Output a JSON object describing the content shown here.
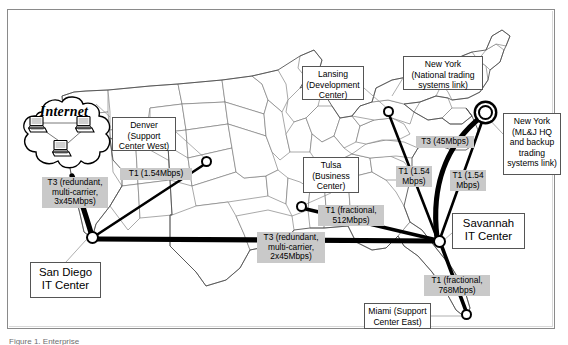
{
  "figure": {
    "kind": "network-topology-map",
    "caption_partial": "Figure 1. Enterprise"
  },
  "cloud": {
    "label": "Internet",
    "node_icons": [
      "computer-icon",
      "computer-icon",
      "computer-icon"
    ]
  },
  "sites": [
    {
      "id": "denver",
      "label": "Denver\n(Support\nCenter West)",
      "box": {
        "x": 112,
        "y": 117,
        "w": 64,
        "h": 34
      }
    },
    {
      "id": "lansing",
      "label": "Lansing\n(Development\nCenter)",
      "box": {
        "x": 302,
        "y": 66,
        "w": 62,
        "h": 34
      }
    },
    {
      "id": "newyork1",
      "label": "New York\n(National trading\nsystems link)",
      "box": {
        "x": 403,
        "y": 56,
        "w": 80,
        "h": 34
      }
    },
    {
      "id": "newyork2",
      "label": "New York\n(ML&J HQ\nand backup\ntrading\nsystems link)",
      "box": {
        "x": 503,
        "y": 113,
        "w": 58,
        "h": 62
      }
    },
    {
      "id": "tulsa",
      "label": "Tulsa\n(Business\nCenter)",
      "box": {
        "x": 303,
        "y": 157,
        "w": 56,
        "h": 36
      }
    },
    {
      "id": "miami",
      "label": "Miami (Support\nCenter East)",
      "box": {
        "x": 364,
        "y": 303,
        "w": 67,
        "h": 26
      }
    },
    {
      "id": "sandiego",
      "label": "San Diego\nIT Center",
      "box": {
        "x": 30,
        "y": 262,
        "w": 71,
        "h": 36
      }
    },
    {
      "id": "savannah",
      "label": "Savannah\nIT Center",
      "box": {
        "x": 452,
        "y": 213,
        "w": 73,
        "h": 36
      }
    }
  ],
  "links": [
    {
      "id": "internet-sandiego",
      "speed": "T3 (redundant,\nmulti-carrier,\n3x45Mbps)",
      "label_box": {
        "x": 42,
        "y": 177,
        "w": 66,
        "h": 32
      }
    },
    {
      "id": "denver-sandiego",
      "speed": "T1 (1.54Mbps)",
      "label_box": {
        "x": 120,
        "y": 168,
        "w": 72,
        "h": 12
      }
    },
    {
      "id": "sandiego-savannah",
      "speed": "T3 (redundant,\nmulti-carrier,\n2x45Mbps)",
      "label_box": {
        "x": 257,
        "y": 232,
        "w": 68,
        "h": 32
      }
    },
    {
      "id": "tulsa-savannah",
      "speed": "T1 (fractional,\n512Mbps)",
      "label_box": {
        "x": 318,
        "y": 205,
        "w": 66,
        "h": 22
      }
    },
    {
      "id": "lansing-savannah",
      "speed": "T1 (1.54\nMbps)",
      "label_box": {
        "x": 396,
        "y": 166,
        "w": 36,
        "h": 22
      }
    },
    {
      "id": "newyork-savannah1",
      "speed": "T3 (45Mbps)",
      "label_box": {
        "x": 416,
        "y": 136,
        "w": 58,
        "h": 12
      }
    },
    {
      "id": "newyork-savannah2",
      "speed": "T1 (1.54\nMbps)",
      "label_box": {
        "x": 450,
        "y": 170,
        "w": 36,
        "h": 22
      }
    },
    {
      "id": "savannah-miami",
      "speed": "T1 (fractional,\n768Mbps)",
      "label_box": {
        "x": 424,
        "y": 275,
        "w": 66,
        "h": 22
      }
    }
  ],
  "nodes": [
    {
      "id": "denver-node",
      "x": 207,
      "y": 162,
      "style": "small"
    },
    {
      "id": "lansing-node",
      "x": 389,
      "y": 112,
      "style": "small"
    },
    {
      "id": "tulsa-node",
      "x": 302,
      "y": 207,
      "style": "small"
    },
    {
      "id": "newyork-node",
      "x": 485,
      "y": 112,
      "style": "dbl"
    },
    {
      "id": "sandiego-node",
      "x": 93,
      "y": 238,
      "style": "big"
    },
    {
      "id": "savannah-node",
      "x": 440,
      "y": 242,
      "style": "big"
    },
    {
      "id": "miami-node",
      "x": 467,
      "y": 315,
      "style": "small"
    }
  ],
  "colors": {
    "link": "#000000",
    "speed_badge_bg": "#c9c9c9",
    "map_stroke": "#6f6f6f",
    "frame": "#8a8a8a"
  }
}
